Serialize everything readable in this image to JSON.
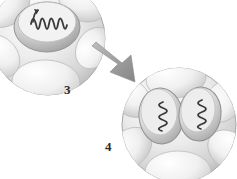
{
  "figure": {
    "type": "cell-division-diagram",
    "background_color": "#ffffff",
    "palette": {
      "cell_light": "#f4f4f4",
      "cell_mid": "#d8d8d8",
      "cell_shadow": "#a9a9a9",
      "outline": "#9a9a9a",
      "nucleus_fill": "#cfcfcf",
      "nucleus_shadow": "#9e9e9e",
      "chromosome": "#3a3a3a",
      "arrow_fill": "#9d9d9d",
      "arrow_shadow": "#7d7d7d",
      "label_color": "#2b2b2b"
    },
    "stages": [
      {
        "label": "3",
        "name": "single-nucleus-cell",
        "nuclei": 1,
        "chromosomes": 1,
        "position": "top-left",
        "clipped": true
      },
      {
        "label": "4",
        "name": "two-nuclei-cell",
        "nuclei": 2,
        "chromosomes": 2,
        "position": "bottom-right",
        "clipped": true
      }
    ],
    "connector": {
      "name": "transition-arrow",
      "direction": "down-right",
      "from_stage": "3",
      "to_stage": "4"
    },
    "labels": {
      "stage_three": "3",
      "stage_four": "4"
    }
  }
}
